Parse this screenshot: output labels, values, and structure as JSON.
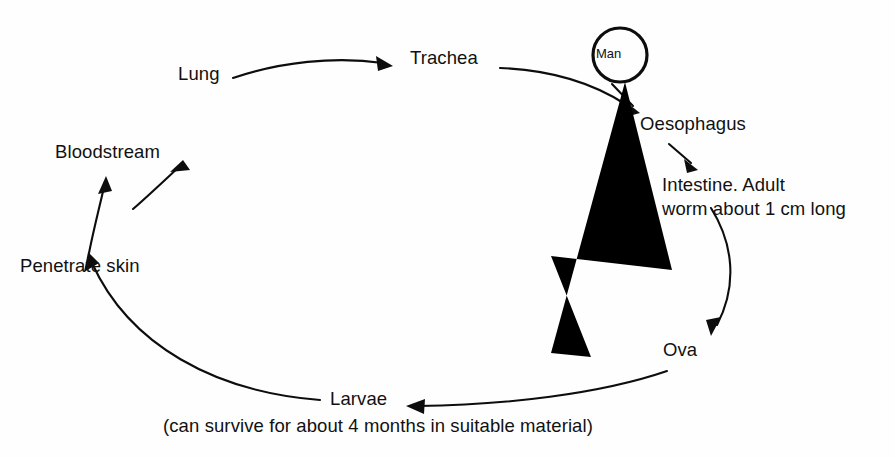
{
  "diagram": {
    "type": "cycle-diagram",
    "background_color": "#fefefe",
    "ink_color": "#0d0d0d",
    "nodes": [
      {
        "id": "lung",
        "label": "Lung",
        "x": 178,
        "y": 72
      },
      {
        "id": "trachea",
        "label": "Trachea",
        "x": 410,
        "y": 56
      },
      {
        "id": "man",
        "label": "Man",
        "x": 600,
        "y": 45
      },
      {
        "id": "oesophagus",
        "label": "Oesophagus",
        "x": 640,
        "y": 115
      },
      {
        "id": "intestine_1",
        "label": "Intestine. Adult",
        "x": 662,
        "y": 172
      },
      {
        "id": "intestine_2",
        "label": "worm about 1 cm long",
        "x": 662,
        "y": 197
      },
      {
        "id": "ova",
        "label": "Ova",
        "x": 663,
        "y": 340
      },
      {
        "id": "larvae",
        "label": "Larvae",
        "x": 330,
        "y": 389
      },
      {
        "id": "penetrate",
        "label": "Penetrate skin",
        "x": 20,
        "y": 256
      },
      {
        "id": "bloodstream",
        "label": "Bloodstream",
        "x": 55,
        "y": 142
      }
    ],
    "caption": {
      "id": "larvae_caption",
      "label": "(can survive for about 4 months in suitable material)",
      "x": 163,
      "y": 417
    },
    "edges": [
      {
        "from": "bloodstream",
        "to": "lung",
        "style": "curved-arrow"
      },
      {
        "from": "lung",
        "to": "trachea",
        "style": "curved-arrow"
      },
      {
        "from": "trachea",
        "to": "man",
        "style": "curve-no-arrow"
      },
      {
        "from": "man",
        "to": "oesophagus",
        "style": "short-arrow"
      },
      {
        "from": "oesophagus",
        "to": "intestine",
        "style": "short-arrow"
      },
      {
        "from": "intestine",
        "to": "ova",
        "style": "curved-arrow"
      },
      {
        "from": "ova",
        "to": "larvae",
        "style": "curved-arrow"
      },
      {
        "from": "larvae",
        "to": "penetrate",
        "style": "curved-arrow"
      },
      {
        "from": "penetrate",
        "to": "bloodstream",
        "style": "curved-arrow"
      }
    ],
    "figure": {
      "name": "stick-figure-man",
      "head_circle": {
        "cx": 620,
        "cy": 55,
        "r": 27
      }
    }
  }
}
